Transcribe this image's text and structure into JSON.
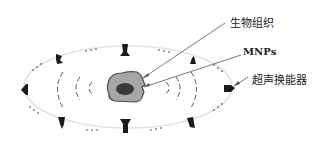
{
  "diagram": {
    "labels": {
      "tissue": "生物组织",
      "mnps": "MNPs",
      "transducer": "超声换能器"
    },
    "colors": {
      "ring": "#e3e3e3",
      "tissue_fill": "#a6a6a6",
      "tissue_edge": "#4a4a4a",
      "mnp_fill": "#3a3a3a",
      "transducer": "#1a1a1a",
      "wave": "#555555",
      "leader": "#555555"
    }
  }
}
